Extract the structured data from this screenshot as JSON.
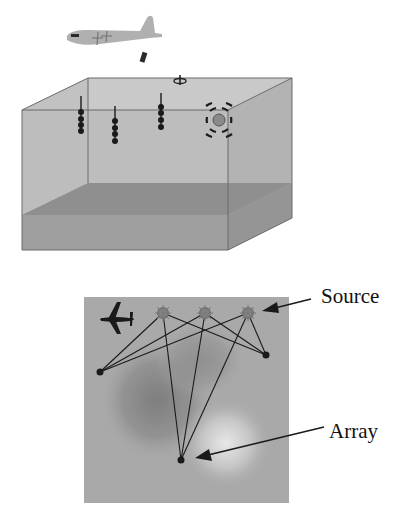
{
  "figure": {
    "top_panel": {
      "description": "3D ocean box with aircraft, sonobuoy, hydrophone arrays and acoustic source",
      "elements": [
        "aircraft-icon",
        "sonobuoy-icon",
        "surface-buoy-icon",
        "hydrophone-array",
        "hydrophone-array",
        "hydrophone-array",
        "sound-source-icon",
        "seafloor-layer"
      ]
    },
    "bottom_panel": {
      "description": "Plan view map with sources, receivers and ray paths",
      "labels": {
        "source": "Source",
        "array": "Array"
      },
      "sources": [
        {
          "x": 163,
          "y": 313
        },
        {
          "x": 205,
          "y": 313
        },
        {
          "x": 248,
          "y": 313
        }
      ],
      "receivers": [
        {
          "x": 100,
          "y": 372
        },
        {
          "x": 266,
          "y": 355
        },
        {
          "x": 181,
          "y": 460
        }
      ]
    },
    "colors": {
      "water": "#bdbdbd",
      "water_back": "#c8c8c8",
      "seafloor_top": "#8e8e8e",
      "seafloor_front": "#a0a0a0",
      "map_bg": "#a9a9a9",
      "ink": "#1a1a1a"
    }
  }
}
